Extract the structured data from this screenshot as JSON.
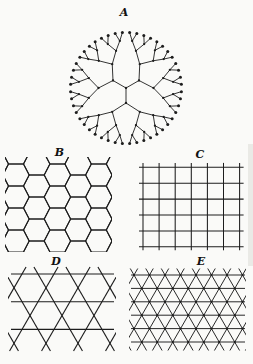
{
  "figure": {
    "background": "#fafaf8",
    "ink": "#1d1d1d",
    "label_color": "#111111",
    "panels": [
      {
        "label": "A",
        "type": "bethe",
        "geometry": {
          "cx": 126,
          "cy": 88,
          "radii": [
            15,
            27.5,
            38.5,
            47.5,
            55.5
          ],
          "branch_angles": [
            -30,
            -150,
            90
          ],
          "spreads": [
            30,
            15,
            7.5,
            3.75
          ],
          "node_r": 1.15,
          "leaf_r": 1.5,
          "label_x": 124,
          "label_y": 16
        }
      },
      {
        "label": "B",
        "type": "honeycomb",
        "geometry": {
          "clip": [
            5,
            157,
            107,
            95
          ],
          "a": 7.5,
          "dx": 5.7,
          "h": 11,
          "ox": 16,
          "oy": 175,
          "i0": -1,
          "i1": 5,
          "j0": -1,
          "j1": 3,
          "label_x": 59.5,
          "label_y": 156
        }
      },
      {
        "label": "C",
        "type": "square",
        "geometry": {
          "x0": 143,
          "y0": 167.3,
          "col_step": 16.1,
          "row_step": 15.9,
          "n_cols": 7,
          "n_rows": 6,
          "overhang": 4,
          "label_x": 200,
          "label_y": 158
        }
      },
      {
        "label": "D",
        "type": "kagome",
        "geometry": {
          "clip": [
            8,
            266,
            108,
            86
          ],
          "row_y": [
            274,
            301.7,
            329.4
          ],
          "hx1": 11,
          "hx2": 114,
          "y0": 274,
          "cA0": 22,
          "cB0": 38,
          "period": 32,
          "yTop": 267,
          "yBot": 351,
          "label_x": 56,
          "label_y": 265
        }
      },
      {
        "label": "E",
        "type": "triangular",
        "geometry": {
          "clip": [
            129,
            268,
            117,
            83
          ],
          "y0": 275,
          "row_step": 13.4,
          "n_rows": 6,
          "hx1": 131,
          "hx2": 245,
          "x0": 134,
          "a": 15.5,
          "yTop": 268.5,
          "yBot": 350.5,
          "dot_r": 1.1,
          "label_x": 201,
          "label_y": 265
        }
      }
    ],
    "artifacts": {
      "right_band": {
        "x": 248,
        "y": 144,
        "w": 5,
        "h": 122,
        "color": "#eaeae6"
      }
    }
  }
}
